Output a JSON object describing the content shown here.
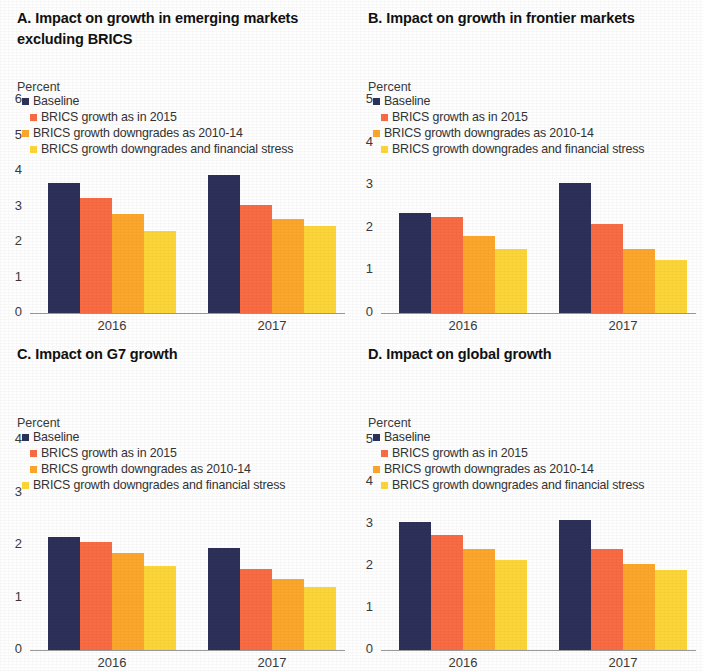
{
  "figure": {
    "axis_unit_label": "Percent",
    "categories": [
      "2016",
      "2017"
    ],
    "series_names": [
      "Baseline",
      "BRICS growth as in 2015",
      "BRICS growth downgrades as 2010-14",
      "BRICS growth downgrades and financial stress"
    ],
    "colors": {
      "baseline": "#2d3058",
      "brics_2015": "#f96b43",
      "brics_downgrades": "#fca72b",
      "brics_stress": "#fcd638"
    }
  },
  "panels": {
    "a": {
      "title": "A. Impact on growth in emerging markets excluding BRICS",
      "unit": "Percent",
      "yticks": [
        "6",
        "5",
        "4",
        "3",
        "2",
        "1",
        "0"
      ],
      "legend": [
        "Baseline",
        "BRICS growth as in 2015",
        "BRICS growth downgrades as 2010-14",
        "BRICS growth downgrades and financial stress"
      ],
      "xlabels": [
        "2016",
        "2017"
      ]
    },
    "b": {
      "title": "B. Impact on growth in frontier markets",
      "unit": "Percent",
      "yticks": [
        "5",
        "4",
        "3",
        "2",
        "1",
        "0"
      ],
      "legend": [
        "Baseline",
        "BRICS growth as in 2015",
        "BRICS growth downgrades as 2010-14",
        "BRICS growth downgrades and financial stress"
      ],
      "xlabels": [
        "2016",
        "2017"
      ]
    },
    "c": {
      "title": "C. Impact on G7 growth",
      "unit": "Percent",
      "yticks": [
        "4",
        "3",
        "2",
        "1",
        "0"
      ],
      "legend": [
        "Baseline",
        "BRICS growth as in 2015",
        "BRICS growth downgrades as 2010-14",
        "BRICS growth downgrades and financial stress"
      ],
      "xlabels": [
        "2016",
        "2017"
      ]
    },
    "d": {
      "title": "D. Impact on global growth",
      "unit": "Percent",
      "yticks": [
        "5",
        "4",
        "3",
        "2",
        "1",
        "0"
      ],
      "legend": [
        "Baseline",
        "BRICS growth as in 2015",
        "BRICS growth downgrades as 2010-14",
        "BRICS growth downgrades and financial stress"
      ],
      "xlabels": [
        "2016",
        "2017"
      ]
    }
  },
  "chart_data": [
    {
      "type": "bar",
      "panel": "A",
      "title": "A. Impact on growth in emerging markets excluding BRICS",
      "xlabel": "",
      "ylabel": "Percent",
      "ylim": [
        0,
        6
      ],
      "yticks": [
        0,
        1,
        2,
        3,
        4,
        5,
        6
      ],
      "grid": false,
      "legend_position": "top-left",
      "categories": [
        "2016",
        "2017"
      ],
      "series": [
        {
          "name": "Baseline",
          "color": "#2d3058",
          "values": [
            3.65,
            3.9
          ]
        },
        {
          "name": "BRICS growth as in 2015",
          "color": "#f96b43",
          "values": [
            3.25,
            3.05
          ]
        },
        {
          "name": "BRICS growth downgrades as 2010-14",
          "color": "#fca72b",
          "values": [
            2.8,
            2.65
          ]
        },
        {
          "name": "BRICS growth downgrades and financial stress",
          "color": "#fcd638",
          "values": [
            2.3,
            2.45
          ]
        }
      ]
    },
    {
      "type": "bar",
      "panel": "B",
      "title": "B. Impact on growth in frontier markets",
      "xlabel": "",
      "ylabel": "Percent",
      "ylim": [
        0,
        5
      ],
      "yticks": [
        0,
        1,
        2,
        3,
        4,
        5
      ],
      "grid": false,
      "legend_position": "top-left",
      "categories": [
        "2016",
        "2017"
      ],
      "series": [
        {
          "name": "Baseline",
          "color": "#2d3058",
          "values": [
            2.35,
            3.05
          ]
        },
        {
          "name": "BRICS growth as in 2015",
          "color": "#f96b43",
          "values": [
            2.25,
            2.1
          ]
        },
        {
          "name": "BRICS growth downgrades as 2010-14",
          "color": "#fca72b",
          "values": [
            1.8,
            1.5
          ]
        },
        {
          "name": "BRICS growth downgrades and financial stress",
          "color": "#fcd638",
          "values": [
            1.5,
            1.25
          ]
        }
      ]
    },
    {
      "type": "bar",
      "panel": "C",
      "title": "C. Impact on G7 growth",
      "xlabel": "",
      "ylabel": "Percent",
      "ylim": [
        0,
        4
      ],
      "yticks": [
        0,
        1,
        2,
        3,
        4
      ],
      "grid": false,
      "legend_position": "top-left",
      "categories": [
        "2016",
        "2017"
      ],
      "series": [
        {
          "name": "Baseline",
          "color": "#2d3058",
          "values": [
            2.15,
            1.95
          ]
        },
        {
          "name": "BRICS growth as in 2015",
          "color": "#f96b43",
          "values": [
            2.05,
            1.55
          ]
        },
        {
          "name": "BRICS growth downgrades as 2010-14",
          "color": "#fca72b",
          "values": [
            1.85,
            1.35
          ]
        },
        {
          "name": "BRICS growth downgrades and financial stress",
          "color": "#fcd638",
          "values": [
            1.6,
            1.2
          ]
        }
      ]
    },
    {
      "type": "bar",
      "panel": "D",
      "title": "D. Impact on global growth",
      "xlabel": "",
      "ylabel": "Percent",
      "ylim": [
        0,
        5
      ],
      "yticks": [
        0,
        1,
        2,
        3,
        4,
        5
      ],
      "grid": false,
      "legend_position": "top-left",
      "categories": [
        "2016",
        "2017"
      ],
      "series": [
        {
          "name": "Baseline",
          "color": "#2d3058",
          "values": [
            3.05,
            3.1
          ]
        },
        {
          "name": "BRICS growth as in 2015",
          "color": "#f96b43",
          "values": [
            2.75,
            2.4
          ]
        },
        {
          "name": "BRICS growth downgrades as 2010-14",
          "color": "#fca72b",
          "values": [
            2.4,
            2.05
          ]
        },
        {
          "name": "BRICS growth downgrades and financial stress",
          "color": "#fcd638",
          "values": [
            2.15,
            1.9
          ]
        }
      ]
    }
  ]
}
